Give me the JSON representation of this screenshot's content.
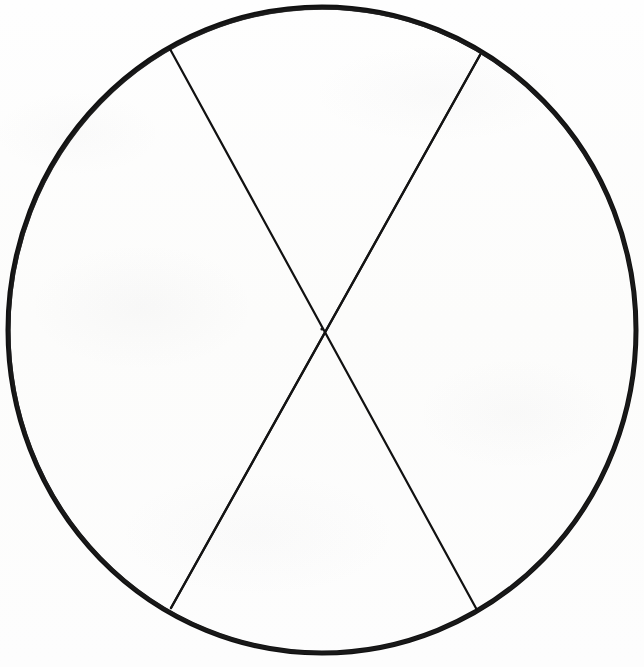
{
  "document": {
    "kind": "scanned-line-drawing",
    "title": "Circle divided into six equal sectors",
    "background_color": "#fdfdfc",
    "ink_color": "#111111",
    "canvas": {
      "width": 644,
      "height": 667
    },
    "visible_text": [],
    "labels": []
  },
  "chart_data": {
    "type": "pie",
    "subtitle": "",
    "xlabel": "",
    "ylabel": "",
    "labels": [
      "",
      "",
      "",
      "",
      "",
      ""
    ],
    "values": [
      1,
      1,
      1,
      1,
      1,
      1
    ],
    "slice_count": 6,
    "slice_fraction_each": "1/6",
    "slice_angle_degrees_each": 60,
    "slice_percent_each": 16.67,
    "all_slices_unshaded": true,
    "legend": [],
    "legend_position": "none",
    "grid": false,
    "geometry": {
      "center_x": 322,
      "center_y": 330,
      "radius_x": 314,
      "radius_y": 323,
      "outline_stroke_width": 5,
      "divider_stroke_width": 2.2,
      "divider_count": 3,
      "divider_angles_degrees": [
        0,
        60,
        120
      ],
      "divider_endpoints": [
        {
          "x1": 8,
          "y1": 328,
          "x2": 636,
          "y2": 328
        },
        {
          "x1": 170,
          "y1": 49,
          "x2": 477,
          "y2": 610
        },
        {
          "x1": 480,
          "y1": 55,
          "x2": 171,
          "y2": 608
        }
      ],
      "outline_extremes": {
        "left_x": 8,
        "right_x": 636,
        "top_y": 7,
        "bottom_y": 653
      }
    },
    "colors": {
      "stroke": "#111111",
      "fill": "none",
      "background": "#fdfdfc"
    }
  }
}
